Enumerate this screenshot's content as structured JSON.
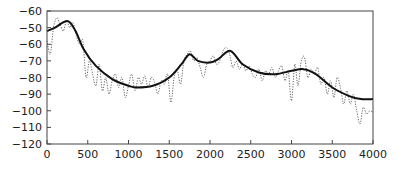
{
  "chart_data": {
    "type": "line",
    "title": "",
    "xlabel": "",
    "ylabel": "",
    "xlim": [
      0,
      4000
    ],
    "ylim": [
      -120,
      -40
    ],
    "grid": false,
    "legend": null,
    "x_ticks": [
      0,
      500,
      1000,
      1500,
      2000,
      2500,
      3000,
      3500,
      4000
    ],
    "x_tick_labels": [
      "0",
      "500",
      "1000",
      "1500",
      "2000",
      "2500",
      "3000",
      "3500",
      "4000"
    ],
    "y_ticks": [
      -40,
      -50,
      -60,
      -70,
      -80,
      -90,
      -100,
      -110,
      -120
    ],
    "y_tick_labels": [
      "-60",
      "-50",
      "-60",
      "-70",
      "-80",
      "-90",
      "-100",
      "-110",
      "-120"
    ],
    "series": [
      {
        "name": "smooth envelope",
        "style": "solid",
        "color": "#111111",
        "x": [
          0,
          100,
          250,
          350,
          450,
          600,
          800,
          1000,
          1100,
          1300,
          1500,
          1650,
          1750,
          1850,
          2000,
          2100,
          2250,
          2400,
          2600,
          2800,
          3000,
          3150,
          3300,
          3500,
          3700,
          3850,
          4000
        ],
        "values": [
          -52,
          -50,
          -46,
          -52,
          -63,
          -73,
          -81,
          -85,
          -86,
          -85,
          -80,
          -72,
          -66,
          -70,
          -71,
          -69,
          -64,
          -72,
          -77,
          -78,
          -76,
          -75,
          -78,
          -86,
          -91,
          -93,
          -93
        ]
      },
      {
        "name": "raw spectrum",
        "style": "dotted",
        "color": "#555555",
        "x": [
          0,
          40,
          80,
          120,
          160,
          200,
          240,
          280,
          320,
          360,
          400,
          440,
          480,
          520,
          560,
          600,
          640,
          680,
          720,
          760,
          800,
          840,
          880,
          920,
          960,
          1000,
          1040,
          1080,
          1120,
          1160,
          1200,
          1240,
          1280,
          1320,
          1360,
          1400,
          1440,
          1480,
          1520,
          1560,
          1600,
          1640,
          1680,
          1720,
          1760,
          1800,
          1840,
          1880,
          1920,
          1960,
          2000,
          2040,
          2080,
          2120,
          2160,
          2200,
          2240,
          2280,
          2320,
          2360,
          2400,
          2440,
          2480,
          2520,
          2560,
          2600,
          2640,
          2680,
          2720,
          2760,
          2800,
          2840,
          2880,
          2920,
          2960,
          3000,
          3040,
          3080,
          3120,
          3160,
          3200,
          3240,
          3280,
          3320,
          3360,
          3400,
          3440,
          3480,
          3520,
          3560,
          3600,
          3640,
          3680,
          3720,
          3760,
          3800,
          3840,
          3880,
          3920,
          3960,
          4000
        ],
        "values": [
          -58,
          -66,
          -50,
          -44,
          -48,
          -52,
          -46,
          -50,
          -47,
          -55,
          -60,
          -58,
          -80,
          -70,
          -78,
          -85,
          -72,
          -88,
          -80,
          -90,
          -82,
          -78,
          -86,
          -80,
          -92,
          -85,
          -78,
          -88,
          -80,
          -84,
          -79,
          -86,
          -80,
          -83,
          -90,
          -82,
          -84,
          -78,
          -95,
          -80,
          -76,
          -84,
          -70,
          -66,
          -64,
          -70,
          -68,
          -74,
          -80,
          -72,
          -70,
          -67,
          -72,
          -70,
          -64,
          -62,
          -66,
          -74,
          -70,
          -75,
          -72,
          -76,
          -73,
          -78,
          -80,
          -75,
          -82,
          -76,
          -78,
          -74,
          -80,
          -76,
          -73,
          -82,
          -76,
          -94,
          -72,
          -85,
          -70,
          -68,
          -80,
          -75,
          -78,
          -74,
          -84,
          -80,
          -90,
          -82,
          -92,
          -80,
          -86,
          -96,
          -88,
          -96,
          -90,
          -100,
          -108,
          -98,
          -102,
          -100,
          -101
        ]
      }
    ]
  }
}
